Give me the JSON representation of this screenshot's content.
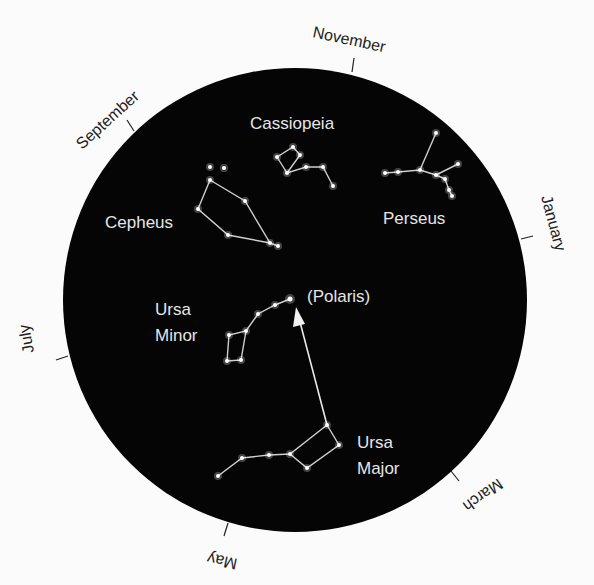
{
  "diagram": {
    "sky_disc": {
      "cx": 295,
      "cy": 300,
      "r": 232,
      "color": "#050505"
    },
    "months": [
      {
        "label": "November",
        "angle": -7
      },
      {
        "label": "January",
        "angle": 62
      },
      {
        "label": "March",
        "angle": 150
      },
      {
        "label": "May",
        "angle": 196
      },
      {
        "label": "July",
        "angle": 254
      },
      {
        "label": "September",
        "angle": -50
      }
    ],
    "constellations": [
      {
        "name": "Cassiopeia"
      },
      {
        "name": "Perseus"
      },
      {
        "name": "Cepheus"
      },
      {
        "name": "Ursa Minor",
        "lines": [
          "Ursa",
          "Minor"
        ]
      },
      {
        "name": "Ursa Major",
        "lines": [
          "Ursa",
          "Major"
        ]
      }
    ],
    "polaris_label": "(Polaris)",
    "pointer": "Arrow from Ursa Major pointer stars to Polaris"
  }
}
